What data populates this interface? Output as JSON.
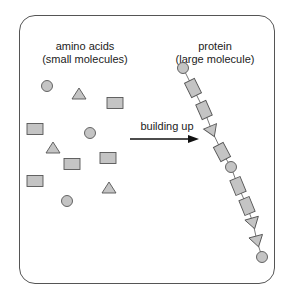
{
  "diagram": {
    "left_title": "amino acids",
    "left_subtitle": "(small molecules)",
    "right_title": "protein",
    "right_subtitle": "(large molecule)",
    "arrow_label": "building up"
  },
  "colors": {
    "shape_fill": "#c4c4c4",
    "shape_stroke": "#555555",
    "frame": "#555555",
    "text": "#222222"
  },
  "free_amino_acids": [
    {
      "shape": "circle",
      "x": 47,
      "y": 86
    },
    {
      "shape": "triangle",
      "x": 79,
      "y": 94
    },
    {
      "shape": "rect",
      "x": 115,
      "y": 103
    },
    {
      "shape": "rect",
      "x": 35,
      "y": 129
    },
    {
      "shape": "circle",
      "x": 90,
      "y": 133
    },
    {
      "shape": "triangle",
      "x": 53,
      "y": 148
    },
    {
      "shape": "rect",
      "x": 72,
      "y": 164
    },
    {
      "shape": "rect",
      "x": 108,
      "y": 158
    },
    {
      "shape": "rect",
      "x": 35,
      "y": 181
    },
    {
      "shape": "triangle",
      "x": 109,
      "y": 188
    },
    {
      "shape": "circle",
      "x": 67,
      "y": 201
    }
  ],
  "protein_chain": [
    {
      "shape": "circle",
      "x": 183,
      "y": 68
    },
    {
      "shape": "rect",
      "x": 193,
      "y": 88
    },
    {
      "shape": "rect",
      "x": 204,
      "y": 110
    },
    {
      "shape": "triangle",
      "x": 212,
      "y": 131
    },
    {
      "shape": "rect",
      "x": 222,
      "y": 152
    },
    {
      "shape": "circle",
      "x": 231,
      "y": 167
    },
    {
      "shape": "rect",
      "x": 238,
      "y": 186
    },
    {
      "shape": "rect",
      "x": 247,
      "y": 206
    },
    {
      "shape": "triangle",
      "x": 253,
      "y": 223
    },
    {
      "shape": "triangle",
      "x": 257,
      "y": 241
    },
    {
      "shape": "circle",
      "x": 262,
      "y": 257
    }
  ]
}
